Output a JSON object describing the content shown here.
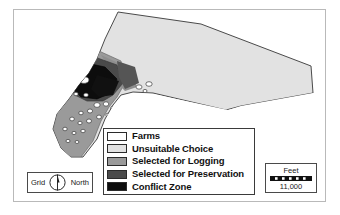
{
  "figure": {
    "frame_color": "#b9b9b9",
    "background": "#ffffff"
  },
  "legend": {
    "name": "map-legend",
    "border_color": "#3a3a3a",
    "items": [
      {
        "label": "Farms",
        "color": "#ffffff",
        "swatch_name": "legend-swatch-farms"
      },
      {
        "label": "Unsuitable Choice",
        "color": "#e2e2e2",
        "swatch_name": "legend-swatch-unsuitable-choice"
      },
      {
        "label": "Selected for Logging",
        "color": "#9a9a9a",
        "swatch_name": "legend-swatch-selected-for-logging"
      },
      {
        "label": "Selected for Preservation",
        "color": "#4a4a4a",
        "swatch_name": "legend-swatch-selected-for-preservation"
      },
      {
        "label": "Conflict Zone",
        "color": "#0d0d0d",
        "swatch_name": "legend-swatch-conflict-zone"
      }
    ]
  },
  "north_arrow": {
    "left_label": "Grid",
    "right_label": "North",
    "needle_color": "#1a1a1a"
  },
  "scale_bar": {
    "units_label": "Feet",
    "value_label": "11,000",
    "bar_color": "#111111"
  },
  "map_data": {
    "type": "choropleth-polygon-map",
    "outline_color": "#4a4a4a",
    "classes": [
      {
        "name": "Farms",
        "color": "#ffffff"
      },
      {
        "name": "Unsuitable Choice",
        "color": "#e2e2e2"
      },
      {
        "name": "Selected for Logging",
        "color": "#9a9a9a"
      },
      {
        "name": "Selected for Preservation",
        "color": "#4a4a4a"
      },
      {
        "name": "Conflict Zone",
        "color": "#0d0d0d"
      }
    ]
  }
}
